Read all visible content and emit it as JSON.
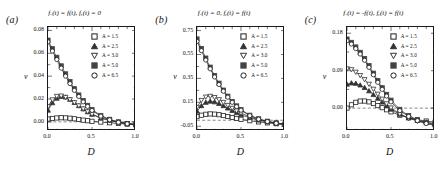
{
  "figure": {
    "xlabel": "D",
    "ylabel": "v",
    "series_labels": [
      "A = 1.5",
      "A = 2.5",
      "A = 3.0",
      "A = 5.0",
      "A = 6.5"
    ],
    "series_markers": [
      "open-square",
      "filled-triangle-up",
      "open-triangle-down",
      "filled-square",
      "open-circle"
    ],
    "series_colors": [
      "#222222",
      "#333333",
      "#333333",
      "#444444",
      "#222222"
    ],
    "xticks": [
      "0.0",
      "0.5",
      "1.0"
    ],
    "xlim": [
      0.0,
      1.0
    ]
  },
  "panels": [
    {
      "tag": "(a)",
      "title_prefix": "f",
      "title": "fₓ(t) = f(t), fᵧ(t) = 0",
      "yticks": [
        "0.00",
        "0.02",
        "0.04",
        "0.06",
        "0.08"
      ]
    },
    {
      "tag": "(b)",
      "title": "fₓ(t) = 0, fᵧ(t) = f(t)",
      "yticks": [
        "-0.05",
        "0.15",
        "0.35",
        "0.55",
        "0.75"
      ]
    },
    {
      "tag": "(c)",
      "title": "fₓ(t) = -f(t), fᵧ(t) = f(t)",
      "yticks": [
        "0.00",
        "0.09",
        "0.18"
      ]
    }
  ],
  "chart_data": [
    {
      "type": "line",
      "title": "f_x(t) = f(t), f_y(t) = 0",
      "panel": "(a)",
      "xlabel": "D",
      "ylabel": "v",
      "xlim": [
        0.0,
        1.0
      ],
      "ylim": [
        -0.008,
        0.083
      ],
      "ytick_values": [
        0.0,
        0.02,
        0.04,
        0.06,
        0.08
      ],
      "xtick_values": [
        0.0,
        0.5,
        1.0
      ],
      "grid": false,
      "zero_line": true,
      "legend": "upper-right",
      "x": [
        0.0,
        0.05,
        0.1,
        0.15,
        0.2,
        0.25,
        0.3,
        0.35,
        0.4,
        0.45,
        0.5,
        0.6,
        0.7,
        0.8,
        0.9,
        1.0
      ],
      "series": [
        {
          "name": "A = 1.5",
          "values": [
            0.0025,
            0.003,
            0.0034,
            0.0036,
            0.0035,
            0.0032,
            0.0027,
            0.0021,
            0.0015,
            0.001,
            0.0005,
            -0.0002,
            -0.0008,
            -0.0014,
            -0.002,
            -0.0026
          ]
        },
        {
          "name": "A = 2.5",
          "values": [
            0.01,
            0.0165,
            0.0205,
            0.022,
            0.0215,
            0.0195,
            0.0168,
            0.014,
            0.0112,
            0.0086,
            0.0064,
            0.0032,
            0.0012,
            -0.0004,
            -0.0015,
            -0.0024
          ]
        },
        {
          "name": "A = 3.0",
          "values": [
            0.0135,
            0.0195,
            0.0225,
            0.0228,
            0.0216,
            0.0196,
            0.017,
            0.0142,
            0.0115,
            0.009,
            0.0068,
            0.0036,
            0.0014,
            -0.0002,
            -0.0013,
            -0.0022
          ]
        },
        {
          "name": "A = 5.0",
          "values": [
            0.0715,
            0.064,
            0.0565,
            0.049,
            0.042,
            0.0352,
            0.029,
            0.0235,
            0.0186,
            0.0144,
            0.0108,
            0.0056,
            0.0022,
            0.0,
            -0.0014,
            -0.0024
          ]
        },
        {
          "name": "A = 6.5",
          "values": [
            0.07,
            0.062,
            0.0545,
            0.047,
            0.04,
            0.0335,
            0.0275,
            0.0222,
            0.0175,
            0.0135,
            0.01,
            0.005,
            0.0018,
            -0.0004,
            -0.0017,
            -0.0027
          ]
        }
      ]
    },
    {
      "type": "line",
      "title": "f_x(t) = 0, f_y(t) = f(t)",
      "panel": "(b)",
      "xlabel": "D",
      "ylabel": "v",
      "xlim": [
        0.0,
        1.0
      ],
      "ylim": [
        -0.09,
        0.78
      ],
      "ytick_values": [
        -0.05,
        0.15,
        0.35,
        0.55,
        0.75
      ],
      "xtick_values": [
        0.0,
        0.5,
        1.0
      ],
      "grid": false,
      "zero_line": true,
      "legend": "upper-right",
      "x": [
        0.0,
        0.05,
        0.1,
        0.15,
        0.2,
        0.25,
        0.3,
        0.35,
        0.4,
        0.45,
        0.5,
        0.6,
        0.7,
        0.8,
        0.9,
        1.0
      ],
      "series": [
        {
          "name": "A = 1.5",
          "values": [
            0.03,
            0.042,
            0.05,
            0.053,
            0.051,
            0.046,
            0.039,
            0.031,
            0.023,
            0.015,
            0.008,
            -0.004,
            -0.014,
            -0.022,
            -0.029,
            -0.035
          ]
        },
        {
          "name": "A = 2.5",
          "values": [
            0.075,
            0.12,
            0.148,
            0.158,
            0.152,
            0.138,
            0.12,
            0.1,
            0.08,
            0.062,
            0.046,
            0.02,
            0.0,
            -0.014,
            -0.026,
            -0.036
          ]
        },
        {
          "name": "A = 3.0",
          "values": [
            0.11,
            0.168,
            0.196,
            0.202,
            0.192,
            0.174,
            0.151,
            0.126,
            0.102,
            0.08,
            0.06,
            0.028,
            0.004,
            -0.012,
            -0.024,
            -0.034
          ]
        },
        {
          "name": "A = 5.0",
          "values": [
            0.68,
            0.6,
            0.52,
            0.444,
            0.374,
            0.31,
            0.252,
            0.201,
            0.157,
            0.12,
            0.089,
            0.042,
            0.012,
            -0.008,
            -0.022,
            -0.033
          ]
        },
        {
          "name": "A = 6.5",
          "values": [
            0.66,
            0.582,
            0.504,
            0.43,
            0.362,
            0.299,
            0.243,
            0.193,
            0.15,
            0.114,
            0.084,
            0.038,
            0.009,
            -0.011,
            -0.025,
            -0.036
          ]
        }
      ]
    },
    {
      "type": "line",
      "title": "f_x(t) = -f(t), f_y(t) = f(t)",
      "panel": "(c)",
      "xlabel": "D",
      "ylabel": "v",
      "xlim": [
        0.0,
        1.0
      ],
      "ylim": [
        -0.055,
        0.195
      ],
      "ytick_values": [
        0.0,
        0.09,
        0.18
      ],
      "xtick_values": [
        0.0,
        0.5,
        1.0
      ],
      "grid": false,
      "zero_line": true,
      "legend": "upper-right",
      "x": [
        0.0,
        0.05,
        0.1,
        0.15,
        0.2,
        0.25,
        0.3,
        0.35,
        0.4,
        0.45,
        0.5,
        0.6,
        0.7,
        0.8,
        0.9,
        1.0
      ],
      "series": [
        {
          "name": "A = 1.5",
          "values": [
            0.0,
            0.008,
            0.014,
            0.017,
            0.017,
            0.015,
            0.011,
            0.006,
            0.001,
            -0.004,
            -0.009,
            -0.017,
            -0.023,
            -0.028,
            -0.031,
            -0.034
          ]
        },
        {
          "name": "A = 2.5",
          "values": [
            0.057,
            0.06,
            0.059,
            0.055,
            0.049,
            0.041,
            0.032,
            0.023,
            0.014,
            0.005,
            -0.003,
            -0.015,
            -0.024,
            -0.03,
            -0.034,
            -0.037
          ]
        },
        {
          "name": "A = 3.0",
          "values": [
            0.095,
            0.093,
            0.087,
            0.079,
            0.069,
            0.058,
            0.046,
            0.034,
            0.022,
            0.011,
            0.001,
            -0.014,
            -0.024,
            -0.031,
            -0.036,
            -0.039
          ]
        },
        {
          "name": "A = 5.0",
          "values": [
            0.166,
            0.158,
            0.147,
            0.134,
            0.119,
            0.102,
            0.084,
            0.066,
            0.049,
            0.033,
            0.019,
            -0.003,
            -0.018,
            -0.028,
            -0.035,
            -0.04
          ]
        },
        {
          "name": "A = 6.5",
          "values": [
            0.162,
            0.154,
            0.143,
            0.13,
            0.115,
            0.098,
            0.08,
            0.062,
            0.045,
            0.029,
            0.015,
            -0.006,
            -0.02,
            -0.03,
            -0.037,
            -0.042
          ]
        }
      ]
    }
  ]
}
